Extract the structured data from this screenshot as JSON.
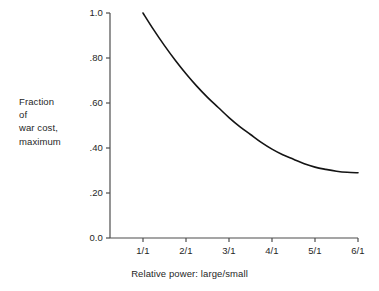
{
  "chart_data": {
    "type": "line",
    "title": "",
    "subtitle": "",
    "xlabel": "Relative power: large/small",
    "ylabel": "Fraction of war cost, maximum",
    "ylabel_lines": [
      "Fraction",
      "of",
      "war cost,",
      "maximum"
    ],
    "x_tick_labels": [
      "1/1",
      "2/1",
      "3/1",
      "4/1",
      "5/1",
      "6/1"
    ],
    "x_tick_values": [
      1,
      2,
      3,
      4,
      5,
      6
    ],
    "y_tick_labels": [
      "0.0",
      ".20",
      ".40",
      ".60",
      ".80",
      "1.0"
    ],
    "y_tick_values": [
      0.0,
      0.2,
      0.4,
      0.6,
      0.8,
      1.0
    ],
    "xlim": [
      0.3,
      6.0
    ],
    "ylim": [
      0.0,
      1.0
    ],
    "grid": false,
    "legend": null,
    "legend_position": "none",
    "line_color": "#141414",
    "axis_color": "#4d4d4d",
    "series": [
      {
        "name": "Fraction of war cost, maximum",
        "x": [
          1.0,
          1.25,
          1.5,
          1.75,
          2.0,
          2.25,
          2.5,
          2.75,
          3.0,
          3.25,
          3.5,
          3.75,
          4.0,
          4.25,
          4.5,
          4.75,
          5.0,
          5.25,
          5.5,
          5.75,
          6.0
        ],
        "y": [
          1.0,
          0.925,
          0.855,
          0.79,
          0.73,
          0.675,
          0.625,
          0.58,
          0.535,
          0.495,
          0.46,
          0.425,
          0.395,
          0.37,
          0.35,
          0.33,
          0.315,
          0.305,
          0.297,
          0.292,
          0.29
        ]
      }
    ]
  },
  "axes": {
    "x_title": "Relative power: large/small"
  }
}
